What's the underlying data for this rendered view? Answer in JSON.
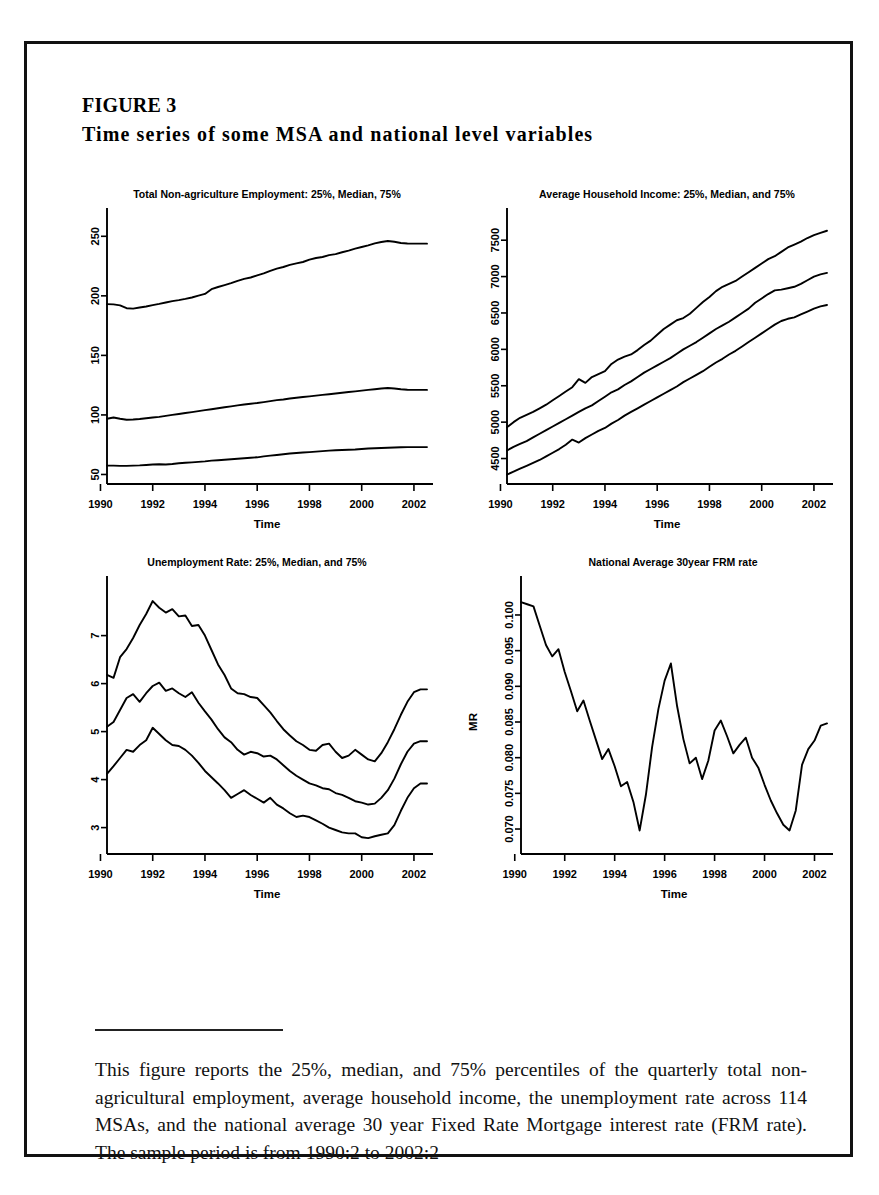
{
  "figure": {
    "label": "FIGURE 3",
    "title": "Time series of some MSA and national level variables"
  },
  "caption": {
    "text": "This figure reports the 25%, median, and 75% percentiles of the quarterly total non-agricultural employment, average household income, the unemployment rate across 114 MSAs, and the national average 30 year Fixed Rate Mortgage interest rate (FRM rate). The sample period is from 1990:2 to 2002:2"
  },
  "chart_data": [
    {
      "id": "employment",
      "type": "line",
      "title": "Total Non-agriculture Employment: 25%, Median, 75%",
      "xlabel": "Time",
      "ylabel": "",
      "xlim": [
        1990.25,
        2002.5
      ],
      "ylim": [
        42,
        262
      ],
      "xticks": [
        1990,
        1992,
        1994,
        1996,
        1998,
        2000,
        2002
      ],
      "yticks": [
        50,
        100,
        150,
        200,
        250
      ],
      "grid": false,
      "legend": "none",
      "x": [
        1990.25,
        1990.5,
        1990.75,
        1991.0,
        1991.25,
        1991.5,
        1991.75,
        1992.0,
        1992.25,
        1992.5,
        1992.75,
        1993.0,
        1993.25,
        1993.5,
        1993.75,
        1994.0,
        1994.25,
        1994.5,
        1994.75,
        1995.0,
        1995.25,
        1995.5,
        1995.75,
        1996.0,
        1996.25,
        1996.5,
        1996.75,
        1997.0,
        1997.25,
        1997.5,
        1997.75,
        1998.0,
        1998.25,
        1998.5,
        1998.75,
        1999.0,
        1999.25,
        1999.5,
        1999.75,
        2000.0,
        2000.25,
        2000.5,
        2000.75,
        2001.0,
        2001.25,
        2001.5,
        2001.75,
        2002.0,
        2002.25,
        2002.5
      ],
      "series": [
        {
          "name": "75%",
          "values": [
            193.0,
            192.8,
            192.0,
            189.6,
            189.3,
            190.2,
            191.0,
            192.2,
            193.2,
            194.4,
            195.6,
            196.4,
            197.4,
            198.6,
            200.2,
            201.6,
            205.6,
            207.4,
            209.0,
            210.6,
            212.6,
            214.2,
            215.4,
            217.2,
            218.8,
            221.0,
            222.8,
            224.2,
            226.0,
            227.2,
            228.4,
            230.4,
            231.8,
            232.6,
            234.2,
            235.0,
            236.6,
            238.0,
            239.6,
            241.0,
            242.4,
            244.0,
            245.2,
            246.0,
            245.4,
            244.4,
            244.0,
            243.8,
            243.8,
            243.8
          ]
        },
        {
          "name": "Median",
          "values": [
            96.8,
            97.8,
            96.8,
            96.0,
            96.2,
            96.6,
            97.2,
            97.8,
            98.4,
            99.2,
            100.0,
            100.8,
            101.6,
            102.4,
            103.2,
            104.0,
            104.8,
            105.6,
            106.4,
            107.2,
            108.0,
            108.8,
            109.4,
            110.0,
            110.8,
            111.6,
            112.4,
            113.0,
            113.8,
            114.4,
            115.0,
            115.6,
            116.2,
            116.8,
            117.4,
            118.0,
            118.6,
            119.2,
            119.8,
            120.4,
            121.0,
            121.6,
            122.2,
            122.6,
            122.2,
            121.6,
            121.2,
            121.0,
            121.0,
            121.0
          ]
        },
        {
          "name": "25%",
          "values": [
            57.4,
            57.4,
            57.2,
            57.2,
            57.4,
            57.6,
            58.0,
            58.4,
            58.6,
            58.4,
            58.8,
            59.4,
            59.8,
            60.2,
            60.6,
            61.0,
            61.6,
            62.0,
            62.4,
            62.8,
            63.2,
            63.6,
            64.0,
            64.4,
            65.2,
            65.8,
            66.4,
            67.0,
            67.6,
            68.0,
            68.4,
            68.8,
            69.2,
            69.6,
            70.0,
            70.4,
            70.6,
            70.8,
            71.0,
            71.4,
            71.8,
            72.0,
            72.2,
            72.4,
            72.6,
            72.8,
            73.0,
            73.0,
            73.0,
            73.0
          ]
        }
      ]
    },
    {
      "id": "household-income",
      "type": "line",
      "title": "Average Household Income: 25%, Median, and 75%",
      "xlabel": "Time",
      "ylabel": "",
      "xlim": [
        1990.25,
        2002.5
      ],
      "ylim": [
        4150,
        7750
      ],
      "xticks": [
        1990,
        1992,
        1994,
        1996,
        1998,
        2000,
        2002
      ],
      "yticks": [
        4500,
        5000,
        5500,
        6000,
        6500,
        7000,
        7500
      ],
      "grid": false,
      "legend": "none",
      "x": [
        1990.25,
        1990.5,
        1990.75,
        1991.0,
        1991.25,
        1991.5,
        1991.75,
        1992.0,
        1992.25,
        1992.5,
        1992.75,
        1993.0,
        1993.25,
        1993.5,
        1993.75,
        1994.0,
        1994.25,
        1994.5,
        1994.75,
        1995.0,
        1995.25,
        1995.5,
        1995.75,
        1996.0,
        1996.25,
        1996.5,
        1996.75,
        1997.0,
        1997.25,
        1997.5,
        1997.75,
        1998.0,
        1998.25,
        1998.5,
        1998.75,
        1999.0,
        1999.25,
        1999.5,
        1999.75,
        2000.0,
        2000.25,
        2000.5,
        2000.75,
        2001.0,
        2001.25,
        2001.5,
        2001.75,
        2002.0,
        2002.25,
        2002.5
      ],
      "series": [
        {
          "name": "75%",
          "values": [
            4930,
            5000,
            5060,
            5100,
            5140,
            5190,
            5240,
            5300,
            5360,
            5420,
            5480,
            5590,
            5540,
            5620,
            5660,
            5700,
            5800,
            5860,
            5900,
            5930,
            5990,
            6060,
            6120,
            6200,
            6280,
            6340,
            6400,
            6430,
            6490,
            6570,
            6650,
            6720,
            6800,
            6860,
            6900,
            6940,
            7000,
            7060,
            7120,
            7180,
            7240,
            7280,
            7340,
            7400,
            7440,
            7480,
            7530,
            7570,
            7600,
            7630
          ]
        },
        {
          "name": "Median",
          "values": [
            4610,
            4660,
            4700,
            4740,
            4790,
            4840,
            4890,
            4940,
            4990,
            5040,
            5090,
            5140,
            5190,
            5230,
            5290,
            5350,
            5410,
            5450,
            5510,
            5560,
            5620,
            5680,
            5730,
            5780,
            5830,
            5880,
            5940,
            6000,
            6050,
            6100,
            6160,
            6220,
            6280,
            6330,
            6380,
            6440,
            6500,
            6560,
            6640,
            6700,
            6760,
            6810,
            6820,
            6840,
            6860,
            6900,
            6950,
            7000,
            7030,
            7050
          ]
        },
        {
          "name": "25%",
          "values": [
            4280,
            4320,
            4360,
            4400,
            4440,
            4480,
            4530,
            4580,
            4630,
            4690,
            4760,
            4720,
            4780,
            4830,
            4880,
            4920,
            4980,
            5030,
            5090,
            5140,
            5190,
            5240,
            5290,
            5340,
            5390,
            5440,
            5490,
            5550,
            5600,
            5650,
            5700,
            5760,
            5820,
            5870,
            5930,
            5980,
            6040,
            6100,
            6160,
            6220,
            6280,
            6340,
            6390,
            6420,
            6440,
            6480,
            6520,
            6560,
            6590,
            6610
          ]
        }
      ]
    },
    {
      "id": "unemployment-rate",
      "type": "line",
      "title": "Unemployment Rate: 25%, Median, and 75%",
      "xlabel": "Time",
      "ylabel": "",
      "xlim": [
        1990.25,
        2002.5
      ],
      "ylim": [
        2.45,
        7.95
      ],
      "xticks": [
        1990,
        1992,
        1994,
        1996,
        1998,
        2000,
        2002
      ],
      "yticks": [
        3,
        4,
        5,
        6,
        7
      ],
      "grid": false,
      "legend": "none",
      "x": [
        1990.25,
        1990.5,
        1990.75,
        1991.0,
        1991.25,
        1991.5,
        1991.75,
        1992.0,
        1992.25,
        1992.5,
        1992.75,
        1993.0,
        1993.25,
        1993.5,
        1993.75,
        1994.0,
        1994.25,
        1994.5,
        1994.75,
        1995.0,
        1995.25,
        1995.5,
        1995.75,
        1996.0,
        1996.25,
        1996.5,
        1996.75,
        1997.0,
        1997.25,
        1997.5,
        1997.75,
        1998.0,
        1998.25,
        1998.5,
        1998.75,
        1999.0,
        1999.25,
        1999.5,
        1999.75,
        2000.0,
        2000.25,
        2000.5,
        2000.75,
        2001.0,
        2001.25,
        2001.5,
        2001.75,
        2002.0,
        2002.25,
        2002.5
      ],
      "series": [
        {
          "name": "75%",
          "values": [
            6.18,
            6.12,
            6.55,
            6.72,
            6.95,
            7.22,
            7.45,
            7.72,
            7.58,
            7.48,
            7.55,
            7.4,
            7.42,
            7.2,
            7.22,
            7.0,
            6.7,
            6.4,
            6.18,
            5.9,
            5.8,
            5.78,
            5.72,
            5.7,
            5.55,
            5.4,
            5.22,
            5.05,
            4.92,
            4.8,
            4.72,
            4.62,
            4.6,
            4.72,
            4.75,
            4.58,
            4.45,
            4.5,
            4.62,
            4.52,
            4.42,
            4.38,
            4.55,
            4.78,
            5.05,
            5.35,
            5.62,
            5.82,
            5.88,
            5.88
          ]
        },
        {
          "name": "Median",
          "values": [
            5.1,
            5.2,
            5.45,
            5.7,
            5.78,
            5.62,
            5.8,
            5.95,
            6.02,
            5.85,
            5.9,
            5.8,
            5.72,
            5.82,
            5.6,
            5.42,
            5.25,
            5.05,
            4.88,
            4.78,
            4.62,
            4.52,
            4.58,
            4.55,
            4.48,
            4.5,
            4.42,
            4.3,
            4.18,
            4.08,
            4.0,
            3.92,
            3.88,
            3.82,
            3.8,
            3.72,
            3.68,
            3.62,
            3.55,
            3.52,
            3.48,
            3.5,
            3.62,
            3.78,
            4.02,
            4.32,
            4.58,
            4.75,
            4.8,
            4.8
          ]
        },
        {
          "name": "25%",
          "values": [
            4.12,
            4.28,
            4.45,
            4.62,
            4.58,
            4.72,
            4.82,
            5.08,
            4.95,
            4.82,
            4.72,
            4.7,
            4.62,
            4.5,
            4.35,
            4.18,
            4.05,
            3.92,
            3.78,
            3.62,
            3.7,
            3.78,
            3.68,
            3.6,
            3.52,
            3.62,
            3.48,
            3.4,
            3.3,
            3.22,
            3.25,
            3.22,
            3.15,
            3.08,
            3.0,
            2.95,
            2.9,
            2.88,
            2.88,
            2.8,
            2.78,
            2.82,
            2.85,
            2.88,
            3.05,
            3.35,
            3.62,
            3.82,
            3.92,
            3.92
          ]
        }
      ]
    },
    {
      "id": "frm-rate",
      "type": "line",
      "title": "National Average 30year FRM rate",
      "xlabel": "Time",
      "ylabel": "MR",
      "xlim": [
        1990.25,
        2002.5
      ],
      "ylim": [
        0.0665,
        0.1035
      ],
      "xticks": [
        1990,
        1992,
        1994,
        1996,
        1998,
        2000,
        2002
      ],
      "yticks": [
        0.07,
        0.075,
        0.08,
        0.085,
        0.09,
        0.095,
        0.1
      ],
      "ytick_labels": [
        "0.070",
        "0.075",
        "0.080",
        "0.085",
        "0.090",
        "0.095",
        "0.100"
      ],
      "grid": false,
      "legend": "none",
      "x": [
        1990.25,
        1990.5,
        1990.75,
        1991.0,
        1991.25,
        1991.5,
        1991.75,
        1992.0,
        1992.25,
        1992.5,
        1992.75,
        1993.0,
        1993.25,
        1993.5,
        1993.75,
        1994.0,
        1994.25,
        1994.5,
        1994.75,
        1995.0,
        1995.25,
        1995.5,
        1995.75,
        1996.0,
        1996.25,
        1996.5,
        1996.75,
        1997.0,
        1997.25,
        1997.5,
        1997.75,
        1998.0,
        1998.25,
        1998.5,
        1998.75,
        1999.0,
        1999.25,
        1999.5,
        1999.75,
        2000.0,
        2000.25,
        2000.5,
        2000.75,
        2001.0,
        2001.25,
        2001.5,
        2001.75,
        2002.0,
        2002.25,
        2002.5
      ],
      "series": [
        {
          "name": "MR",
          "values": [
            0.1018,
            0.1015,
            0.1012,
            0.0985,
            0.096,
            0.0942,
            0.0952,
            0.092,
            0.0895,
            0.0868,
            0.088,
            0.0852,
            0.0828,
            0.08,
            0.0812,
            0.079,
            0.0762,
            0.0768,
            0.074,
            0.07,
            0.0745,
            0.081,
            0.0862,
            0.0905,
            0.093,
            0.0872,
            0.0828,
            0.0795,
            0.08,
            0.0772,
            0.0798,
            0.0838,
            0.085,
            0.0832,
            0.081,
            0.0818,
            0.0828,
            0.08,
            0.0788,
            0.0765,
            0.0742,
            0.0722,
            0.0708,
            0.0702,
            0.0728,
            0.079,
            0.0812,
            0.0822,
            0.0845,
            0.0848
          ]
        },
        {
          "name": "MR-cont",
          "values": [
            0.0848,
            0.0825,
            0.079,
            0.0752,
            0.076,
            0.0728,
            0.074,
            0.0752,
            0.0745,
            0.0718,
            0.07,
            0.0688,
            0.0675
          ]
        }
      ]
    }
  ],
  "frm_full": {
    "x": [
      1990.25,
      1990.5,
      1990.75,
      1991.0,
      1991.25,
      1991.5,
      1991.75,
      1992.0,
      1992.25,
      1992.5,
      1992.75,
      1993.0,
      1993.25,
      1993.5,
      1993.75,
      1994.0,
      1994.25,
      1994.5,
      1994.75,
      1995.0,
      1995.25,
      1995.5,
      1995.75,
      1996.0,
      1996.25,
      1996.5,
      1996.75,
      1997.0,
      1997.25,
      1997.5,
      1997.75,
      1998.0,
      1998.25,
      1998.5,
      1998.75,
      1999.0,
      1999.25,
      1999.5,
      1999.75,
      2000.0,
      2000.25,
      2000.5,
      2000.75,
      2001.0,
      2001.25,
      2001.5,
      2001.75,
      2002.0,
      2002.25,
      2002.5
    ],
    "values": [
      0.1018,
      0.1015,
      0.1012,
      0.0985,
      0.0958,
      0.0942,
      0.0952,
      0.092,
      0.0893,
      0.0865,
      0.088,
      0.0852,
      0.0825,
      0.0798,
      0.0812,
      0.0788,
      0.076,
      0.0766,
      0.0738,
      0.0698,
      0.0748,
      0.0815,
      0.0868,
      0.0908,
      0.0932,
      0.0872,
      0.0826,
      0.0792,
      0.08,
      0.077,
      0.0796,
      0.0838,
      0.0852,
      0.083,
      0.0806,
      0.0818,
      0.0828,
      0.08,
      0.0786,
      0.0762,
      0.074,
      0.0722,
      0.0706,
      0.0698,
      0.0726,
      0.079,
      0.0812,
      0.0824,
      0.0845,
      0.0848
    ]
  }
}
